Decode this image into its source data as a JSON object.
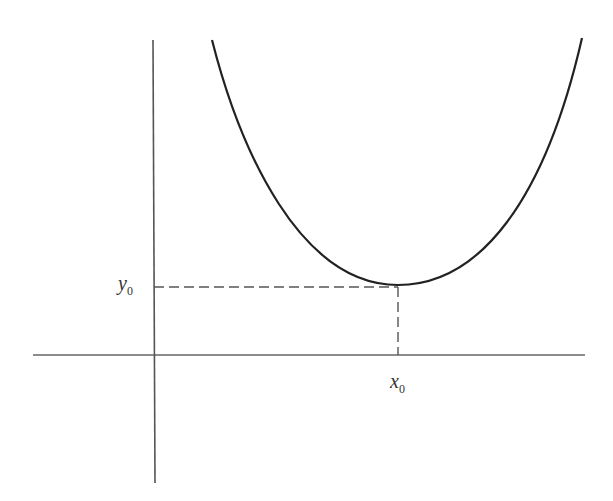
{
  "diagram": {
    "type": "function-minimum-plot",
    "labels": {
      "y0": {
        "main": "y",
        "sub": "0"
      },
      "x0": {
        "main": "x",
        "sub": "0"
      }
    },
    "colors": {
      "axis": "#555555",
      "curve": "#222222",
      "dashed": "#555555"
    }
  }
}
